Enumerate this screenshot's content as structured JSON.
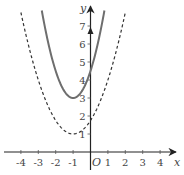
{
  "chart_data": {
    "type": "line",
    "title": "",
    "xlabel": "x",
    "ylabel": "y",
    "origin_label": "O",
    "xlim": [
      -4.9,
      5.0
    ],
    "ylim": [
      -0.7,
      8.2
    ],
    "grid": false,
    "legend": null,
    "x_ticks": [
      -4,
      -3,
      -2,
      -1,
      1,
      2,
      3,
      4
    ],
    "x_tick_labels": [
      "-4",
      "-3",
      "-2",
      "-1",
      "1",
      "2",
      "3",
      "4"
    ],
    "y_ticks": [
      1,
      2,
      3,
      4,
      5,
      6,
      7
    ],
    "y_tick_labels": [
      "1",
      "2",
      "3",
      "4",
      "5",
      "6",
      "7"
    ],
    "series": [
      {
        "name": "solid parabola",
        "style": "solid",
        "color": "#6e6e6e",
        "vertex": [
          -1,
          3
        ],
        "x": [
          -2.8,
          -2.5,
          -2.0,
          -1.5,
          -1.0,
          -0.5,
          0.0,
          0.5,
          0.8
        ],
        "y": [
          7.86,
          6.38,
          4.5,
          3.38,
          3.0,
          3.38,
          4.5,
          6.38,
          7.86
        ]
      },
      {
        "name": "dashed parabola",
        "style": "dashed",
        "color": "#333333",
        "vertex": [
          -1,
          1
        ],
        "x": [
          -4.0,
          -3.5,
          -3.0,
          -2.0,
          -1.0,
          0.0,
          1.0,
          1.5,
          2.0
        ],
        "y": [
          7.75,
          5.69,
          4.0,
          1.75,
          1.0,
          1.75,
          4.0,
          5.69,
          7.75
        ]
      }
    ]
  }
}
